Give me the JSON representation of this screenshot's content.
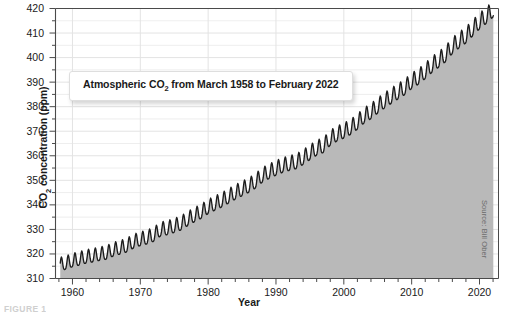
{
  "figure": {
    "caption_fragment": "FIGURE 1",
    "source_credit": "Source: Bill Ober",
    "callout_title_pre": "Atmospheric CO",
    "callout_title_sub": "2",
    "callout_title_post": " from March 1958 to February 2022",
    "ylabel_pre": "CO",
    "ylabel_sub": "2",
    "ylabel_post": " concentration (ppm)",
    "xlabel": "Year"
  },
  "colors": {
    "fill": "#b9b9b9",
    "line": "#1d1d1d",
    "grid_major": "#9b9b9b",
    "grid_minor": "#e3e3e3",
    "axis": "#4a4a4a",
    "plot_bg": "#ffffff",
    "text": "#1a1a1a",
    "source_text": "#6b6b6b"
  },
  "chart_data": {
    "type": "area",
    "title": "Atmospheric CO2 from March 1958 to February 2022",
    "xlabel": "Year",
    "ylabel": "CO2 concentration (ppm)",
    "xlim": [
      1957.5,
      2022.8
    ],
    "ylim": [
      310,
      420
    ],
    "grid": true,
    "legend": "none",
    "ytick_values": [
      310,
      320,
      330,
      340,
      350,
      360,
      370,
      380,
      390,
      400,
      410,
      420
    ],
    "ytick_minor_step": 5,
    "xtick_values": [
      1960,
      1970,
      1980,
      1990,
      2000,
      2010,
      2020
    ],
    "xtick_minor_step": 2,
    "annotation": "Keeling Curve: monthly mean CO2 with seasonal sawtooth oscillation superimposed on a rising, accelerating trend.",
    "seasonal_amplitude_ppm": [
      3.0,
      3.6
    ],
    "series": [
      {
        "name": "Monthly mean CO2 (ppm)",
        "x": [
          1958.2,
          1959,
          1960,
          1961,
          1962,
          1963,
          1964,
          1965,
          1966,
          1967,
          1968,
          1969,
          1970,
          1971,
          1972,
          1973,
          1974,
          1975,
          1976,
          1977,
          1978,
          1979,
          1980,
          1981,
          1982,
          1983,
          1984,
          1985,
          1986,
          1987,
          1988,
          1989,
          1990,
          1991,
          1992,
          1993,
          1994,
          1995,
          1996,
          1997,
          1998,
          1999,
          2000,
          2001,
          2002,
          2003,
          2004,
          2005,
          2006,
          2007,
          2008,
          2009,
          2010,
          2011,
          2012,
          2013,
          2014,
          2015,
          2016,
          2017,
          2018,
          2019,
          2020,
          2021,
          2022.1
        ],
        "values": [
          315.3,
          315.9,
          316.9,
          317.6,
          318.4,
          318.9,
          319.5,
          320.0,
          321.3,
          322.1,
          323.0,
          324.6,
          325.6,
          326.3,
          327.4,
          329.6,
          330.1,
          331.0,
          332.0,
          333.8,
          335.4,
          336.8,
          338.7,
          340.1,
          341.4,
          343.0,
          344.6,
          346.0,
          347.4,
          349.2,
          351.6,
          353.1,
          354.4,
          355.6,
          356.4,
          357.1,
          358.8,
          360.8,
          362.6,
          363.7,
          366.7,
          368.4,
          369.6,
          371.1,
          373.2,
          375.8,
          377.5,
          379.8,
          381.9,
          383.8,
          385.6,
          387.4,
          389.9,
          391.6,
          393.9,
          396.5,
          398.6,
          400.8,
          404.2,
          406.5,
          408.5,
          411.4,
          414.2,
          416.5,
          419.3
        ]
      }
    ]
  }
}
